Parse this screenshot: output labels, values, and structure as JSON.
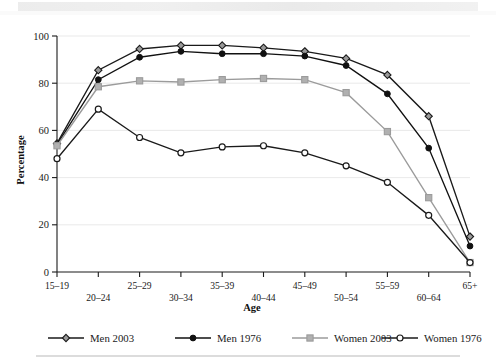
{
  "chart_data": {
    "type": "line",
    "title": "",
    "xlabel": "Age",
    "ylabel": "Percentage",
    "ylim": [
      0,
      100
    ],
    "yticks": [
      0,
      20,
      40,
      60,
      80,
      100
    ],
    "grid": true,
    "legend_position": "bottom",
    "categories": [
      "15–19",
      "20–24",
      "25–29",
      "30–34",
      "35–39",
      "40–44",
      "45–49",
      "50–54",
      "55–59",
      "60–64",
      "65+"
    ],
    "series": [
      {
        "name": "Men 2003",
        "color": "#8a8a8a",
        "line_color": "#1a1a1a",
        "marker": "diamond",
        "marker_fill": "#9a9a9a",
        "values": [
          54.5,
          85.5,
          94.5,
          96,
          96,
          95,
          93.5,
          90.5,
          83.5,
          66,
          15
        ]
      },
      {
        "name": "Men 1976",
        "color": "#111111",
        "line_color": "#111111",
        "marker": "circle-filled",
        "marker_fill": "#111111",
        "values": [
          54,
          81.5,
          91,
          93.5,
          92.5,
          92.5,
          91.5,
          87.5,
          75.5,
          52.5,
          11
        ]
      },
      {
        "name": "Women 2003",
        "color": "#9b9b9b",
        "line_color": "#9b9b9b",
        "marker": "square",
        "marker_fill": "#b0b0b0",
        "values": [
          53.5,
          78.5,
          81,
          80.5,
          81.5,
          82,
          81.5,
          76,
          59.5,
          31.5,
          4
        ]
      },
      {
        "name": "Women 1976",
        "color": "#1a1a1a",
        "line_color": "#1a1a1a",
        "marker": "circle-open",
        "marker_fill": "#ffffff",
        "values": [
          48,
          69,
          57,
          50.5,
          53,
          53.5,
          50.5,
          45,
          38,
          24,
          4
        ]
      }
    ]
  },
  "legend": {
    "items": [
      {
        "label": "Men 2003"
      },
      {
        "label": "Men 1976"
      },
      {
        "label": "Women 2003"
      },
      {
        "label": "Women 1976"
      }
    ]
  },
  "axis": {
    "y_title": "Percentage",
    "x_title": "Age",
    "y_tick_labels": [
      "0",
      "20",
      "40",
      "60",
      "80",
      "100"
    ],
    "x_tick_labels": [
      "15–19",
      "20–24",
      "25–29",
      "30–34",
      "35–39",
      "40–44",
      "45–49",
      "50–54",
      "55–59",
      "60–64",
      "65+"
    ]
  }
}
